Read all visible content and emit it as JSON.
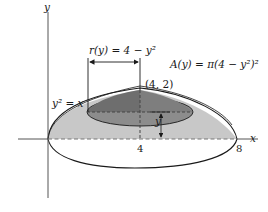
{
  "figure": {
    "axes": {
      "x_label": "x",
      "y_label": "y",
      "x_ticks": [
        "4",
        "8"
      ]
    },
    "labels": {
      "radius": "r(y) = 4 − y²",
      "area": "A(y) = π(4 − y²)²",
      "point": "(4, 2)",
      "curve": "y² = x",
      "height": "y"
    },
    "colors": {
      "axis": "#555555",
      "outline": "#1a1a1a",
      "light_region": "#c8c8c8",
      "dark_disk": "#8c8c8c",
      "darker_cap": "#6e6e6e",
      "dashed": "#777777"
    }
  }
}
